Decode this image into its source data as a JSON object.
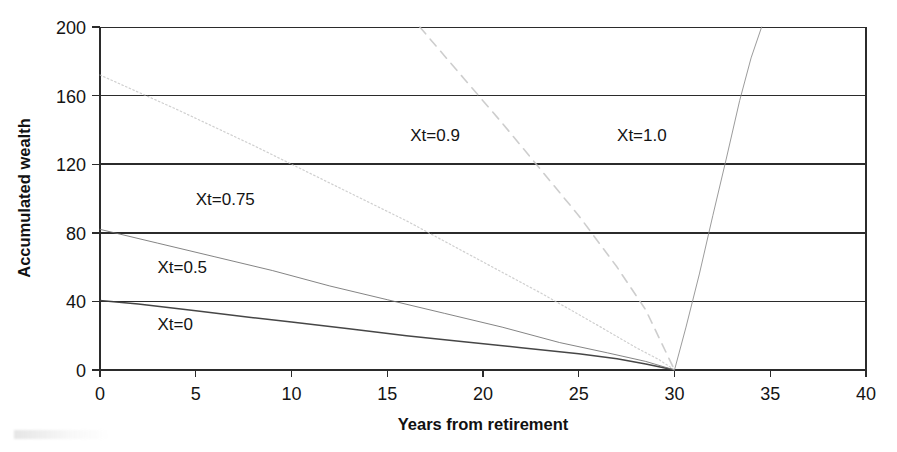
{
  "figure": {
    "background_color": "#ffffff",
    "ink_color": "#141414"
  },
  "chart_data": {
    "type": "line",
    "title": "",
    "subtitle": "",
    "xlabel": "Years from retirement",
    "ylabel": "Accumulated wealth",
    "xlim": [
      0,
      40
    ],
    "ylim": [
      0,
      200
    ],
    "xticks": [
      0,
      5,
      10,
      15,
      20,
      25,
      30,
      35,
      40
    ],
    "xticklabels": [
      "0",
      "5",
      "10",
      "15",
      "20",
      "25",
      "30",
      "35",
      "40"
    ],
    "yticks": [
      0,
      40,
      80,
      120,
      160,
      200
    ],
    "yticklabels": [
      "0",
      "40",
      "80",
      "120",
      "160",
      "200"
    ],
    "grid": "horizontal",
    "legend_position": "inline-annotations",
    "series": [
      {
        "name": "Xt=0",
        "label": "Xt=0",
        "style": "solid",
        "color": "#3c3c3c",
        "label_x": 3.0,
        "label_y": 27,
        "x": [
          0,
          2,
          5,
          8,
          10,
          13,
          16,
          19,
          22,
          25,
          27,
          28.5,
          30
        ],
        "y": [
          40.5,
          38.5,
          34.5,
          30.5,
          28,
          24,
          20,
          16.5,
          13,
          9.5,
          6.5,
          3.5,
          0
        ]
      },
      {
        "name": "Xt=0.5",
        "label": "Xt=0.5",
        "style": "solid-thin",
        "color": "#6e6e6e",
        "label_x": 3.0,
        "label_y": 60,
        "x": [
          0,
          3,
          6,
          9,
          12,
          15,
          18,
          21,
          24,
          26.5,
          28.5,
          30
        ],
        "y": [
          82,
          74,
          66,
          58,
          49,
          41,
          33,
          25,
          16,
          10,
          5,
          0
        ]
      },
      {
        "name": "Xt=0.75",
        "label": "Xt=0.75",
        "style": "dotted",
        "color": "#bfbfbf",
        "label_x": 5.0,
        "label_y": 100,
        "x": [
          0,
          4,
          8,
          12,
          16,
          20,
          23,
          26,
          28,
          29.2,
          30
        ],
        "y": [
          172,
          152,
          131,
          109,
          87,
          63,
          45,
          26,
          13,
          6,
          0
        ]
      },
      {
        "name": "Xt=0.9",
        "label": "Xt=0.9",
        "style": "dashed",
        "color": "#c4c4c4",
        "label_x": 16.2,
        "label_y": 137,
        "x": [
          16.7,
          19,
          21,
          23,
          25,
          27,
          28.5,
          30
        ],
        "y": [
          200,
          170,
          144,
          117,
          90,
          60,
          35,
          0
        ]
      },
      {
        "name": "Xt=1.0",
        "label": "Xt=1.0",
        "style": "solid-thin",
        "color": "#8a8a8a",
        "label_x": 27.0,
        "label_y": 137,
        "x": [
          30,
          30.6,
          31.3,
          32.0,
          32.7,
          33.4,
          34.0,
          34.55
        ],
        "y": [
          0,
          25,
          56,
          90,
          123,
          157,
          182,
          200
        ]
      }
    ]
  },
  "annotations": {
    "y_axis_title": "Accumulated wealth",
    "x_axis_title": "Years from retirement"
  }
}
